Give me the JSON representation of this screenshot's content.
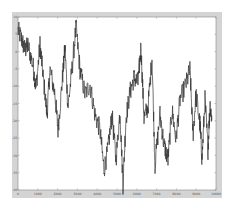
{
  "chart_data": {
    "type": "line",
    "title": "",
    "xlabel": "",
    "ylabel": "",
    "xlim": [
      0,
      10000
    ],
    "ylim": [
      -40,
      10
    ],
    "xticks": [
      0,
      1000,
      2000,
      3000,
      4000,
      5000,
      6000,
      7000,
      8000,
      9000,
      10000
    ],
    "xtick_labels": [
      "0",
      "1000",
      "2000",
      "3000",
      "4000",
      "5000",
      "6000",
      "7000",
      "8000",
      "9000",
      "10000"
    ],
    "yticks": [
      10,
      5,
      0,
      -5,
      -10,
      -15,
      -20,
      -25,
      -30,
      -35,
      -40
    ],
    "ytick_labels": [
      "10",
      "5",
      "0",
      "-5",
      "-10",
      "-15",
      "-20",
      "-25",
      "-30",
      "-35",
      "-40"
    ],
    "grid": false,
    "legend": "none",
    "series": [
      {
        "name": "signal",
        "color": "#333333",
        "x": [
          0,
          202,
          354,
          505,
          758,
          909,
          1111,
          1263,
          1465,
          1616,
          1869,
          2020,
          2222,
          2374,
          2525,
          2727,
          2929,
          3131,
          3384,
          3636,
          3889,
          4141,
          4343,
          4545,
          4747,
          4949,
          5152,
          5303,
          5455,
          5657,
          5859,
          6061,
          6212,
          6364,
          6566,
          6768,
          6919,
          7172,
          7374,
          7576,
          7778,
          7980,
          8182,
          8485,
          8687,
          8838,
          8990,
          9192,
          9293,
          9444,
          9596,
          9697,
          9798
        ],
        "y": [
          6.2,
          3.3,
          0.4,
          1.8,
          -4.0,
          -10.6,
          2.0,
          -6.6,
          -18.2,
          -5.2,
          -12.4,
          -22.6,
          -9.5,
          1.2,
          -16.1,
          -5.2,
          7.1,
          -5.2,
          -12.4,
          -9.5,
          -18.2,
          -22.6,
          -34.1,
          -28.3,
          -18.2,
          -31.2,
          -17.3,
          -38.4,
          -19.1,
          -11.8,
          -7.5,
          -9.0,
          1.2,
          -19.1,
          -16.1,
          -1.7,
          -32.7,
          -18.2,
          -26.9,
          -31.2,
          -16.8,
          -25.4,
          -13.8,
          -9.5,
          -5.2,
          -24.0,
          -12.4,
          -21.1,
          -31.2,
          -14.0,
          -28.3,
          -15.3,
          -19.9
        ]
      }
    ],
    "colors": {
      "figure_bg": "#d4d4d4",
      "axes_bg": "#ffffff",
      "axis": "#888888",
      "line": "#333333"
    }
  }
}
